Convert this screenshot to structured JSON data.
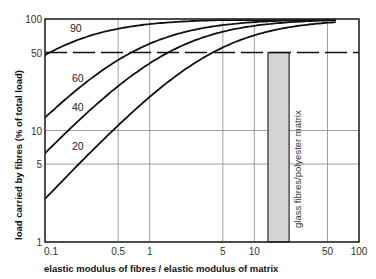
{
  "chart_data": {
    "type": "line",
    "title": "",
    "xlabel": "elastic modulus of fibres / elastic modulus of matrix",
    "ylabel": "load carried by fibres  (% of total load)",
    "xscale": "log",
    "yscale": "log",
    "xlim": [
      0.1,
      100
    ],
    "ylim": [
      1,
      100
    ],
    "x_ticks": [
      0.1,
      0.5,
      1,
      5,
      10,
      50,
      100
    ],
    "x_tick_labels": [
      "0.1",
      "0.5",
      "1",
      "5",
      "10",
      "50",
      "100"
    ],
    "y_ticks": [
      1,
      5,
      10,
      50,
      100
    ],
    "y_tick_labels": [
      "1",
      "5",
      "10",
      "50",
      "100"
    ],
    "grid": true,
    "legend": "curve labels inline (fibre volume %)",
    "x": [
      0.1,
      0.2,
      0.5,
      1,
      2,
      5,
      10,
      20,
      50,
      60
    ],
    "series": [
      {
        "name": "90",
        "values": [
          50.0,
          64.3,
          81.8,
          90.0,
          94.7,
          97.8,
          98.9,
          99.4,
          99.8,
          99.8
        ]
      },
      {
        "name": "60",
        "values": [
          13.0,
          23.1,
          42.9,
          60.0,
          75.0,
          88.2,
          93.8,
          96.8,
          98.7,
          98.9
        ]
      },
      {
        "name": "40",
        "values": [
          6.3,
          11.8,
          25.0,
          40.0,
          57.1,
          76.9,
          87.0,
          93.0,
          97.1,
          97.6
        ]
      },
      {
        "name": "20",
        "values": [
          2.4,
          4.8,
          11.1,
          20.0,
          33.3,
          55.6,
          71.4,
          83.3,
          92.6,
          93.8
        ]
      }
    ],
    "reference_line": {
      "y": 50,
      "style": "dashed"
    },
    "annotations": [
      {
        "type": "shaded-band",
        "x_range": [
          13.5,
          21.5
        ],
        "y_range": [
          1,
          50
        ],
        "label": "glass fibres/polyester matrix"
      }
    ]
  },
  "labels": {
    "curve_90": "90",
    "curve_60": "60",
    "curve_40": "40",
    "curve_20": "20",
    "band": "glass fibres/polyester matrix",
    "xlabel": "elastic modulus of fibres / elastic modulus of matrix",
    "ylabel": "load carried by fibres  (% of total load)"
  },
  "colors": {
    "line": "#111111",
    "grid": "#888888",
    "band_fill": "#d4d4d4",
    "band_edge": "#444444"
  }
}
